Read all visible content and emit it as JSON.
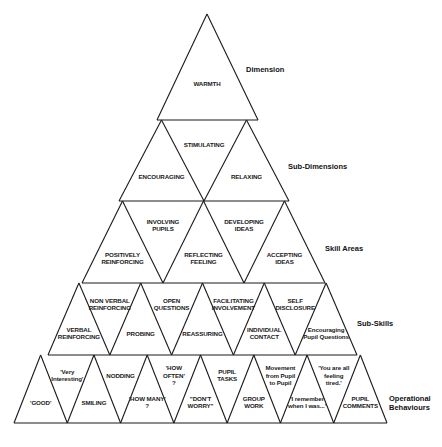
{
  "figure": {
    "type": "hierarchical-pyramid",
    "line_color": "#1a1a1a",
    "background": "#ffffff"
  },
  "levels": [
    {
      "name": "Dimension",
      "label_pos": [
        246,
        65
      ],
      "y_top": 14,
      "y_bottom": 120,
      "x_left": 157,
      "x_right": 258,
      "apex_x": 207,
      "cells": [
        {
          "dir": "up",
          "lines": [
            "WARMTH"
          ]
        }
      ]
    },
    {
      "name": "Sub-Dimensions",
      "label_pos": [
        288,
        162
      ],
      "y_top": 120,
      "y_bottom": 201,
      "x_left": 119,
      "x_right": 289,
      "cells": [
        {
          "dir": "up",
          "lines": [
            "ENCOURAGING"
          ]
        },
        {
          "dir": "down",
          "lines": [
            "STIMULATING"
          ]
        },
        {
          "dir": "up",
          "lines": [
            "RELAXING"
          ]
        }
      ]
    },
    {
      "name": "Skill Areas",
      "label_pos": [
        325,
        244
      ],
      "y_top": 201,
      "y_bottom": 283,
      "x_left": 82,
      "x_right": 325,
      "cells": [
        {
          "dir": "up",
          "lines": [
            "POSITIVELY",
            "REINFORCING"
          ]
        },
        {
          "dir": "down",
          "lines": [
            "INVOLVING",
            "PUPILS"
          ]
        },
        {
          "dir": "up",
          "lines": [
            "REFLECTING",
            "FEELING"
          ]
        },
        {
          "dir": "down",
          "lines": [
            "DEVELOPING",
            "IDEAS"
          ]
        },
        {
          "dir": "up",
          "lines": [
            "ACCEPTING",
            "IDEAS"
          ]
        }
      ]
    },
    {
      "name": "Sub-Skills",
      "label_pos": [
        357,
        319
      ],
      "y_top": 283,
      "y_bottom": 355,
      "x_left": 48,
      "x_right": 357,
      "cells": [
        {
          "dir": "up",
          "lines": [
            "VERBAL",
            "REINFORCING"
          ]
        },
        {
          "dir": "down",
          "lines": [
            "NON VERBAL",
            "REINFORCING"
          ]
        },
        {
          "dir": "up",
          "lines": [
            "PROBING"
          ]
        },
        {
          "dir": "down",
          "lines": [
            "OPEN",
            "QUESTIONS"
          ]
        },
        {
          "dir": "up",
          "lines": [
            "REASSURING"
          ]
        },
        {
          "dir": "down",
          "lines": [
            "FACILITATING",
            "INVOLVEMENT"
          ]
        },
        {
          "dir": "up",
          "lines": [
            "INDIVIDUAL",
            "CONTACT"
          ]
        },
        {
          "dir": "down",
          "lines": [
            "SELF",
            "DISCLOSURE"
          ]
        },
        {
          "dir": "up",
          "lines": [
            "Encouraging",
            "Pupil Questions"
          ]
        }
      ]
    },
    {
      "name": "Operational Behaviours",
      "label_pos": [
        389,
        394
      ],
      "label_lines": [
        "Operational",
        "Behaviours"
      ],
      "y_top": 355,
      "y_bottom": 423,
      "x_left": 14,
      "x_right": 387,
      "cells": [
        {
          "dir": "up",
          "lines": [
            "'GOOD'"
          ]
        },
        {
          "dir": "down",
          "lines": [
            "'Very",
            "Interesting'"
          ]
        },
        {
          "dir": "up",
          "lines": [
            "SMILING"
          ]
        },
        {
          "dir": "down",
          "lines": [
            "NODDING"
          ]
        },
        {
          "dir": "up",
          "lines": [
            "'HOW MANY'",
            "?"
          ]
        },
        {
          "dir": "down",
          "lines": [
            "'HOW",
            "OFTEN'",
            "?"
          ]
        },
        {
          "dir": "up",
          "lines": [
            "\"DON'T",
            "WORRY\""
          ]
        },
        {
          "dir": "down",
          "lines": [
            "PUPIL",
            "TASKS"
          ]
        },
        {
          "dir": "up",
          "lines": [
            "GROUP",
            "WORK"
          ]
        },
        {
          "dir": "down",
          "lines": [
            "Movement",
            "from Pupil",
            "to Pupil"
          ]
        },
        {
          "dir": "up",
          "lines": [
            "'I remember",
            "when I was...'"
          ]
        },
        {
          "dir": "down",
          "lines": [
            "'You are all",
            "feeling",
            "tired.'"
          ]
        },
        {
          "dir": "up",
          "lines": [
            "PUPIL",
            "COMMENTS"
          ]
        }
      ]
    }
  ],
  "row_labels": {
    "dimension": "Dimension",
    "sub_dimensions": "Sub-Dimensions",
    "skill_areas": "Skill Areas",
    "sub_skills": "Sub-Skills",
    "operational_1": "Operational",
    "operational_2": "Behaviours"
  }
}
